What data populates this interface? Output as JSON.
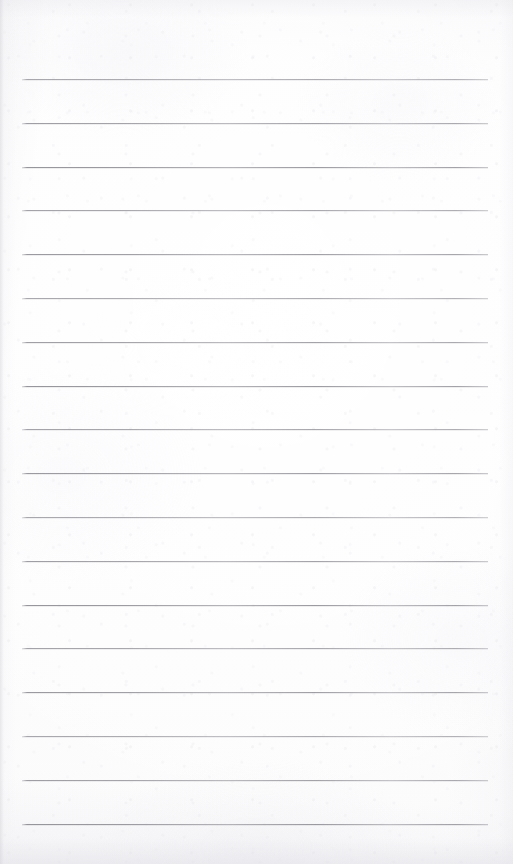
{
  "page": {
    "kind": "lined-notebook-paper-scan",
    "label": "Blank lined notepad page",
    "width_px": 513,
    "height_px": 864,
    "background_color": "#fcfcfd",
    "paper_tone": "off-white",
    "content_text": "",
    "has_writing": false
  },
  "ruling": {
    "name": "horizontal-ruled-lines",
    "line_color": "#92929a",
    "line_thickness_px": 1,
    "line_count": 18,
    "first_line_y": 79,
    "line_spacing_px": 43.8,
    "left_margin_x": 22,
    "right_margin_x": 488,
    "line_length_px": 466,
    "margin_rule": "none",
    "lines_y": [
      79,
      122.8,
      166.6,
      210.4,
      254.2,
      298,
      341.8,
      385.6,
      429.4,
      473.2,
      517,
      560.8,
      604.6,
      648.4,
      692.2,
      736,
      779.8,
      823.6
    ]
  },
  "edges": {
    "left_edge_shadow_color": "#d0d0d6",
    "bottom_edge_shadow_color": "#dbdbe2",
    "top_edge_shadow_color": "#e4e4ea"
  }
}
